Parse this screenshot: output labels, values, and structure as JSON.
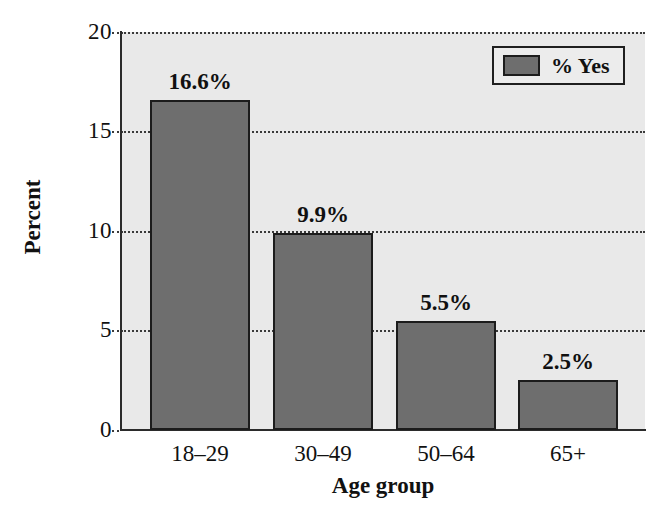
{
  "chart_data": {
    "type": "bar",
    "title": "",
    "xlabel": "Age group",
    "ylabel": "Percent",
    "categories": [
      "18–29",
      "30–49",
      "50–64",
      "65+"
    ],
    "values": [
      16.6,
      9.9,
      5.5,
      2.5
    ],
    "value_labels": [
      "16.6%",
      "9.9%",
      "5.5%",
      "2.5%"
    ],
    "series": [
      {
        "name": "% Yes",
        "values": [
          16.6,
          9.9,
          5.5,
          2.5
        ]
      }
    ],
    "ylim": [
      0,
      20
    ],
    "yticks": [
      0,
      5,
      10,
      15,
      20
    ],
    "ytick_labels": [
      "0",
      "5",
      "10",
      "15",
      "20"
    ],
    "grid": "horizontal-dotted",
    "legend": {
      "position": "top-right",
      "entries": [
        {
          "label": "% Yes",
          "color": "#6e6e6e"
        }
      ]
    },
    "colors": {
      "bar_fill": "#6e6e6e",
      "bar_border": "#1c1c1c",
      "plot_background": "#e9e9e9",
      "axis": "#2b2b2b",
      "gridline": "#3a3a3a",
      "text": "#111111",
      "page_background": "#ffffff"
    }
  }
}
